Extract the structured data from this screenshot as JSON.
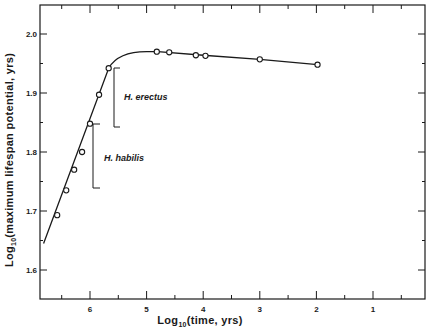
{
  "chart_data": {
    "type": "line",
    "title": "",
    "xlabel": "Log10(time, yrs)",
    "ylabel": "Log10(maximum lifespan potential, yrs)",
    "x_axis_reversed": true,
    "xlim": [
      6.9,
      0.1
    ],
    "ylim": [
      1.55,
      2.05
    ],
    "x_ticks": [
      6,
      5,
      4,
      3,
      2,
      1
    ],
    "x_tick_labels": [
      "6",
      "5",
      "4",
      "3",
      "2",
      "1"
    ],
    "y_ticks": [
      1.6,
      1.7,
      1.8,
      1.9,
      2.0
    ],
    "y_tick_labels": [
      "1.6",
      "1.7",
      "1.8",
      "1.9",
      "2.0"
    ],
    "grid": false,
    "legend": null,
    "series": [
      {
        "name": "data points",
        "x": [
          6.58,
          6.42,
          6.28,
          6.14,
          6.0,
          5.84,
          5.67,
          4.82,
          4.6,
          4.13,
          3.96,
          3.0,
          1.98
        ],
        "y": [
          1.693,
          1.735,
          1.77,
          1.8,
          1.848,
          1.897,
          1.942,
          1.97,
          1.969,
          1.964,
          1.963,
          1.957,
          1.948
        ]
      },
      {
        "name": "fitted curve",
        "x": [
          6.82,
          5.67,
          5.5,
          5.3,
          5.0,
          4.8,
          4.0,
          3.0,
          1.98
        ],
        "y": [
          1.645,
          1.942,
          1.96,
          1.967,
          1.97,
          1.97,
          1.964,
          1.957,
          1.948
        ]
      }
    ],
    "annotations": [
      {
        "text": "H. erectus",
        "bracket_y_range": [
          1.84,
          1.94
        ],
        "bracket_x": 5.55
      },
      {
        "text": "H. habilis",
        "bracket_y_range": [
          1.74,
          1.85
        ],
        "bracket_x": 6.0
      }
    ]
  },
  "labels": {
    "xlabel_main": "Log",
    "xlabel_sub": "10",
    "xlabel_rest": "(time, yrs)",
    "ylabel_main": "Log",
    "ylabel_sub": "10",
    "ylabel_rest": "(maximum lifespan potential, yrs)",
    "annot_erectus": "H. erectus",
    "annot_habilis": "H. habilis"
  }
}
